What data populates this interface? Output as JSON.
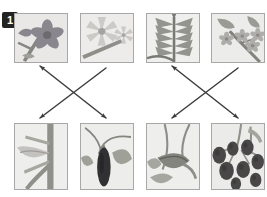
{
  "exercise": {
    "number": "1",
    "header_fragment": "· · ···· ·· ·"
  },
  "colors": {
    "badge_background": "#232323",
    "badge_text": "#ffffff",
    "cell_border": "#a8a8a8",
    "cell_background": "#f2f1ef",
    "arrow": "#3d3d3d",
    "page_background": "#ffffff"
  },
  "top_row": {
    "label": "Flowers and foliage",
    "items": [
      {
        "id": "top-1",
        "name": "eggplant-flower",
        "caption": "Purple star-shaped flower on a stem",
        "x": 14,
        "y": 13,
        "w": 54,
        "h": 50,
        "palette": {
          "petal": "#8e7f9b",
          "petal_dark": "#6d6078",
          "stem": "#7d8470",
          "leaf": "#98a088",
          "bg": "#eceae6"
        }
      },
      {
        "id": "top-2",
        "name": "tomato-flower",
        "caption": "Pale star-shaped flower with pointed petals",
        "x": 80,
        "y": 13,
        "w": 54,
        "h": 50,
        "palette": {
          "petal": "#cfcabf",
          "petal_dark": "#a6a194",
          "stem": "#8b8d78",
          "leaf": "#9ba189",
          "bg": "#f0eeea"
        }
      },
      {
        "id": "top-3",
        "name": "pepper-leaves",
        "caption": "Narrow pointed leaves radiating from a stem",
        "x": 146,
        "y": 13,
        "w": 54,
        "h": 50,
        "palette": {
          "petal": "#9aa089",
          "petal_dark": "#6f7560",
          "stem": "#71775f",
          "leaf": "#8d9479",
          "bg": "#f2f1ec"
        }
      },
      {
        "id": "top-4",
        "name": "potato-flower-cluster",
        "caption": "Cluster of small flowers on a branching stem",
        "x": 211,
        "y": 13,
        "w": 54,
        "h": 50,
        "palette": {
          "petal": "#b0aba0",
          "petal_dark": "#8a857a",
          "stem": "#7b8167",
          "leaf": "#949b80",
          "bg": "#efeee9"
        }
      }
    ]
  },
  "bottom_row": {
    "label": "Fruits",
    "items": [
      {
        "id": "bottom-1",
        "name": "pale-pod-fruit",
        "caption": "Pale elongated pod on a thick stem",
        "x": 14,
        "y": 123,
        "w": 54,
        "h": 67,
        "palette": {
          "fruit": "#c6c2b6",
          "fruit_dark": "#9d998c",
          "stem": "#8a8f76",
          "leaf": "#a2a88d",
          "bg": "#f1f0eb"
        }
      },
      {
        "id": "bottom-2",
        "name": "eggplant-fruit",
        "caption": "Dark purple eggplant hanging from a stem",
        "x": 80,
        "y": 123,
        "w": 54,
        "h": 67,
        "palette": {
          "fruit": "#2b2630",
          "fruit_dark": "#15121a",
          "stem": "#7e8369",
          "leaf": "#9aa184",
          "bg": "#f0efe9"
        }
      },
      {
        "id": "bottom-3",
        "name": "green-pepper-fruit",
        "caption": "Elongated green pepper with leaves",
        "x": 146,
        "y": 123,
        "w": 54,
        "h": 67,
        "palette": {
          "fruit": "#7c8268",
          "fruit_dark": "#555b44",
          "stem": "#878d72",
          "leaf": "#a0a78a",
          "bg": "#f1f0ea"
        }
      },
      {
        "id": "bottom-4",
        "name": "tomato-cluster",
        "caption": "Cluster of round dark berries on a vine",
        "x": 211,
        "y": 123,
        "w": 54,
        "h": 67,
        "palette": {
          "fruit": "#4a3e40",
          "fruit_dark": "#2c2426",
          "stem": "#8b9174",
          "leaf": "#9ea587",
          "bg": "#eeede7"
        }
      }
    ]
  },
  "connections": [
    {
      "id": "link-1",
      "name": "link-top1-to-bottom2",
      "from": "top-1",
      "to": "bottom-2",
      "x1": 106,
      "y1": 68,
      "x2": 40,
      "y2": 118,
      "head": "end"
    },
    {
      "id": "link-2",
      "name": "link-top2-to-bottom1",
      "from": "top-2",
      "to": "bottom-1",
      "x1": 40,
      "y1": 66,
      "x2": 106,
      "y2": 118,
      "head": "both"
    },
    {
      "id": "link-3",
      "name": "link-top3-to-bottom4",
      "from": "top-3",
      "to": "bottom-4",
      "x1": 238,
      "y1": 68,
      "x2": 172,
      "y2": 118,
      "head": "end"
    },
    {
      "id": "link-4",
      "name": "link-top4-to-bottom3",
      "from": "top-4",
      "to": "bottom-3",
      "x1": 172,
      "y1": 66,
      "x2": 238,
      "y2": 118,
      "head": "both"
    }
  ]
}
